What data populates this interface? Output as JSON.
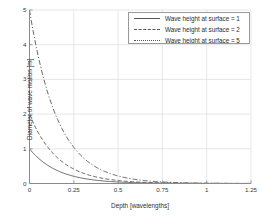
{
  "chart_data": {
    "type": "line",
    "title": "",
    "xlabel": "Depth [wavelengths]",
    "ylabel": "Diameter of wave motion [m]",
    "xlim": [
      0,
      1.25
    ],
    "ylim": [
      0,
      5
    ],
    "xticks": [
      0,
      0.25,
      0.5,
      0.75,
      1,
      1.25
    ],
    "xticklabels": [
      "0",
      "0.25",
      "0.5",
      "0.75",
      "1",
      "1.25"
    ],
    "yticks": [
      0,
      1,
      2,
      3,
      4,
      5
    ],
    "yticklabels": [
      "0",
      "1",
      "2",
      "3",
      "4",
      "5"
    ],
    "grid": true,
    "legend_position": "upper right",
    "x": [
      0,
      0.0625,
      0.125,
      0.1875,
      0.25,
      0.3125,
      0.375,
      0.4375,
      0.5,
      0.5625,
      0.625,
      0.6875,
      0.75,
      0.8125,
      0.875,
      0.9375,
      1.0,
      1.0625,
      1.125,
      1.1875,
      1.25
    ],
    "series": [
      {
        "name": "Wave height at surface = 1",
        "surface_height": 1,
        "linestyle": "solid",
        "color": "#555555",
        "values": [
          1.0,
          0.675,
          0.456,
          0.308,
          0.208,
          0.14,
          0.0948,
          0.064,
          0.0432,
          0.0292,
          0.0197,
          0.0133,
          0.009,
          0.0061,
          0.0041,
          0.0028,
          0.0019,
          0.0013,
          0.0008,
          0.0006,
          0.0004
        ]
      },
      {
        "name": "Wave height at surface = 2",
        "surface_height": 2,
        "linestyle": "dashed",
        "color": "#555555",
        "values": [
          2.0,
          1.351,
          0.912,
          0.616,
          0.416,
          0.281,
          0.19,
          0.128,
          0.0866,
          0.0585,
          0.0395,
          0.0267,
          0.018,
          0.0122,
          0.0082,
          0.0055,
          0.0037,
          0.0025,
          0.0017,
          0.0011,
          0.0008
        ]
      },
      {
        "name": "Wave height at surface = 5",
        "surface_height": 5,
        "linestyle": "dashdot",
        "color": "#555555",
        "values": [
          5.0,
          3.377,
          2.281,
          1.541,
          1.041,
          0.703,
          0.475,
          0.321,
          0.2166,
          0.1463,
          0.0988,
          0.0667,
          0.0451,
          0.0305,
          0.0206,
          0.0139,
          0.0094,
          0.0063,
          0.0043,
          0.0029,
          0.0019
        ]
      }
    ],
    "formula": "D = H * exp(-2*pi*d)"
  },
  "axes": {
    "x_label": "Depth [wavelengths]",
    "y_label": "Diameter of wave motion [m]"
  },
  "legend": {
    "entries": [
      "Wave height at surface = 1",
      "Wave height at surface = 2",
      "Wave height at surface = 5"
    ]
  },
  "colors": {
    "line": "#555555",
    "grid": "#dcdcdc",
    "axis": "#8a8a8a",
    "text": "#2e2e2e",
    "background": "#ffffff"
  }
}
